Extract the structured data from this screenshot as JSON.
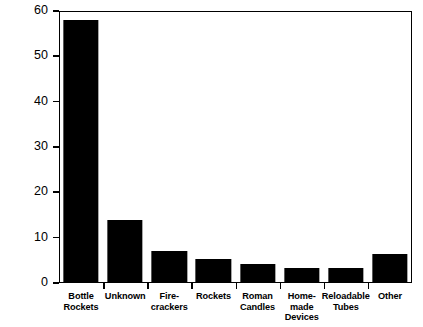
{
  "chart_data": {
    "type": "bar",
    "title": "",
    "xlabel": "",
    "ylabel": "Percent",
    "ylim": [
      0,
      60
    ],
    "yticks": [
      0,
      10,
      20,
      30,
      40,
      50,
      60
    ],
    "ytick_labels": [
      "0",
      "10",
      "20",
      "30",
      "40",
      "50",
      "60"
    ],
    "grid": false,
    "legend": null,
    "bar_color": "#000000",
    "background_color": "#ffffff",
    "categories": [
      "Bottle Rockets",
      "Unknown",
      "Fire-crackers",
      "Rockets",
      "Roman Candles",
      "Home-made Devices",
      "Reloadable Tubes",
      "Other"
    ],
    "category_label_lines": [
      [
        "Bottle",
        "Rockets"
      ],
      [
        "Unknown"
      ],
      [
        "Fire-",
        "crackers"
      ],
      [
        "Rockets"
      ],
      [
        "Roman",
        "Candles"
      ],
      [
        "Home-",
        "made",
        "Devices"
      ],
      [
        "Reloadable",
        "Tubes"
      ],
      [
        "Other"
      ]
    ],
    "values": [
      58,
      14,
      7,
      5.3,
      4.3,
      3.3,
      3.3,
      6.3
    ]
  }
}
